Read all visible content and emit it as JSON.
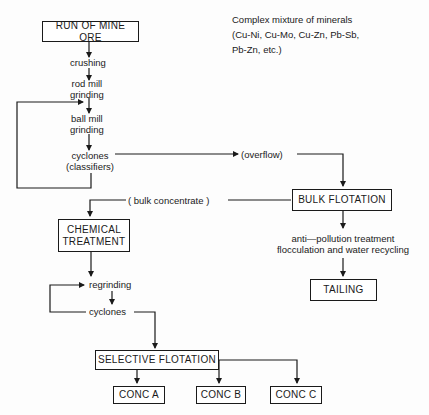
{
  "diagram": {
    "title_note": [
      "Complex mixture of minerals",
      "(Cu-Ni, Cu-Mo, Cu-Zn, Pb-Sb,",
      "Pb-Zn, etc.)"
    ],
    "boxes": {
      "run_of_mine_ore": "RUN OF MINE ORE",
      "bulk_flotation": "BULK FLOTATION",
      "chemical_treatment_1": "CHEMICAL",
      "chemical_treatment_2": "TREATMENT",
      "tailing": "TAILING",
      "selective_flotation": "SELECTIVE FLOTATION",
      "conc_a": "CONC A",
      "conc_b": "CONC B",
      "conc_c": "CONC C"
    },
    "steps": {
      "crushing": "crushing",
      "rod_mill_1": "rod mill",
      "rod_mill_2": "grinding",
      "ball_mill_1": "ball mill",
      "ball_mill_2": "grinding",
      "cyclones_1": "cyclones",
      "cyclones_2": "(classifiers)",
      "overflow": "(overflow)",
      "bulk_concentrate": "( bulk concentrate )",
      "anti_pollution_1": "anti—pollution treatment",
      "anti_pollution_2": "flocculation and water recycling",
      "regrinding": "regrinding",
      "cyclones_b": "cyclones"
    }
  }
}
